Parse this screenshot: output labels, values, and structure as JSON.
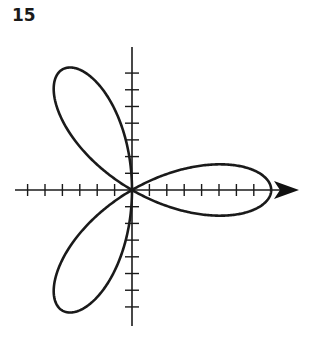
{
  "figure": {
    "label": "15"
  },
  "chart_data": {
    "type": "line",
    "subtype": "polar-rose",
    "title": "",
    "equation_form": "r = a·cos(3θ)",
    "a": 8,
    "petals": 3,
    "petal_directions_deg": [
      0,
      120,
      240
    ],
    "xlabel": "",
    "ylabel": "",
    "x_ticks": {
      "negative": 6,
      "positive": 7
    },
    "y_ticks": {
      "negative": 7,
      "positive": 7
    },
    "xlim": [
      -6.3,
      9.5
    ],
    "ylim": [
      -7.7,
      8.2
    ],
    "grid": false,
    "legend": false,
    "x_axis_arrow": "right",
    "line_color": "#1a1a1a"
  }
}
